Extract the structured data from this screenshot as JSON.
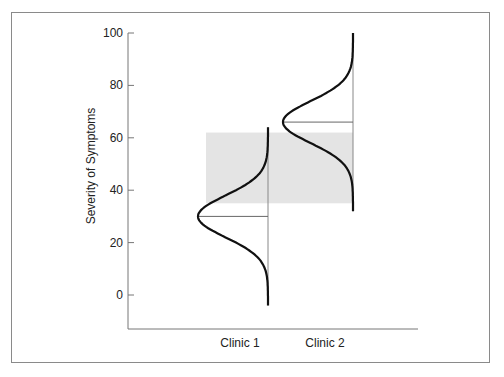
{
  "chart_data": {
    "type": "distribution",
    "title": "",
    "xlabel": "",
    "ylabel": "Severity of Symptoms",
    "ylim": [
      -10,
      100
    ],
    "yticks": [
      0,
      20,
      40,
      60,
      80,
      100
    ],
    "categories": [
      "Clinic 1",
      "Clinic 2"
    ],
    "series": [
      {
        "name": "Clinic 1",
        "mean": 30,
        "range": [
          -4,
          64
        ],
        "sd": 8
      },
      {
        "name": "Clinic 2",
        "mean": 66,
        "range": [
          32,
          100
        ],
        "sd": 8
      }
    ],
    "shaded_band": {
      "from": 35,
      "to": 62
    },
    "grid": false,
    "legend": "none"
  },
  "colors": {
    "curve": "#111111",
    "axis": "#777777",
    "band": "#e4e4e4",
    "frame": "#8a8a8a"
  }
}
